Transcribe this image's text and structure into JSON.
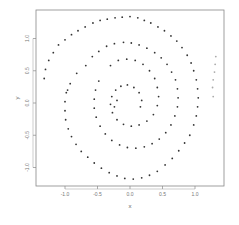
{
  "chart_data": {
    "type": "scatter",
    "title": "",
    "xlabel": "x",
    "ylabel": "y",
    "xlim": [
      -1.45,
      1.45
    ],
    "ylim": [
      -1.3,
      1.45
    ],
    "xticks": [
      -1.0,
      -0.5,
      0.0,
      0.5,
      1.0
    ],
    "xtick_labels": [
      "-1.0",
      "-0.5",
      "0.0",
      "0.5",
      "1.0"
    ],
    "yticks": [
      -1.0,
      -0.5,
      0.0,
      0.5,
      1.0
    ],
    "ytick_labels": [
      "-1.0",
      "-0.5",
      "0.0",
      "0.5",
      "1.0"
    ],
    "grid": false,
    "legend": null,
    "marker_color": "#333333",
    "outlier_color": "#aaaaaa",
    "series": [
      {
        "name": "spiral-arm-outer",
        "points": [
          [
            -1.32,
            0.38
          ],
          [
            -1.3,
            0.52
          ],
          [
            -1.25,
            0.66
          ],
          [
            -1.18,
            0.78
          ],
          [
            -1.1,
            0.9
          ],
          [
            -1.0,
            0.98
          ],
          [
            -0.9,
            1.06
          ],
          [
            -0.8,
            1.12
          ],
          [
            -0.69,
            1.18
          ],
          [
            -0.57,
            1.24
          ],
          [
            -0.46,
            1.28
          ],
          [
            -0.35,
            1.3
          ],
          [
            -0.23,
            1.32
          ],
          [
            -0.12,
            1.33
          ],
          [
            0.0,
            1.34
          ],
          [
            0.12,
            1.32
          ],
          [
            0.22,
            1.28
          ],
          [
            0.32,
            1.24
          ],
          [
            0.43,
            1.18
          ],
          [
            0.53,
            1.12
          ],
          [
            0.63,
            1.04
          ],
          [
            0.72,
            0.96
          ],
          [
            0.8,
            0.86
          ],
          [
            0.88,
            0.74
          ],
          [
            0.94,
            0.62
          ],
          [
            0.98,
            0.5
          ],
          [
            1.02,
            0.36
          ],
          [
            1.04,
            0.22
          ],
          [
            1.05,
            0.08
          ],
          [
            1.04,
            -0.06
          ],
          [
            1.02,
            -0.2
          ],
          [
            0.98,
            -0.34
          ],
          [
            0.92,
            -0.5
          ],
          [
            0.84,
            -0.62
          ],
          [
            0.75,
            -0.74
          ],
          [
            0.65,
            -0.86
          ],
          [
            0.54,
            -0.96
          ],
          [
            0.42,
            -1.06
          ],
          [
            0.3,
            -1.12
          ],
          [
            0.18,
            -1.16
          ],
          [
            0.05,
            -1.18
          ],
          [
            -0.08,
            -1.17
          ],
          [
            -0.2,
            -1.13
          ],
          [
            -0.32,
            -1.08
          ],
          [
            -0.44,
            -1.01
          ],
          [
            -0.55,
            -0.93
          ],
          [
            -0.65,
            -0.84
          ],
          [
            -0.75,
            -0.75
          ],
          [
            -0.83,
            -0.64
          ],
          [
            -0.9,
            -0.52
          ],
          [
            -0.95,
            -0.4
          ],
          [
            -0.99,
            -0.26
          ],
          [
            -1.0,
            -0.12
          ],
          [
            -1.0,
            0.02
          ],
          [
            -0.98,
            0.16
          ]
        ]
      },
      {
        "name": "spiral-arm-inner",
        "points": [
          [
            -0.68,
            0.58
          ],
          [
            -0.58,
            0.72
          ],
          [
            -0.48,
            0.8
          ],
          [
            -0.36,
            0.88
          ],
          [
            -0.24,
            0.92
          ],
          [
            -0.1,
            0.94
          ],
          [
            0.02,
            0.93
          ],
          [
            0.14,
            0.9
          ],
          [
            0.26,
            0.85
          ],
          [
            0.38,
            0.78
          ],
          [
            0.48,
            0.7
          ],
          [
            0.57,
            0.6
          ],
          [
            0.64,
            0.48
          ],
          [
            0.7,
            0.36
          ],
          [
            0.73,
            0.22
          ],
          [
            0.74,
            0.08
          ],
          [
            0.73,
            -0.06
          ],
          [
            0.69,
            -0.2
          ],
          [
            0.63,
            -0.34
          ],
          [
            0.55,
            -0.46
          ],
          [
            0.45,
            -0.56
          ],
          [
            0.34,
            -0.63
          ],
          [
            0.22,
            -0.68
          ],
          [
            0.09,
            -0.7
          ],
          [
            -0.04,
            -0.69
          ],
          [
            -0.16,
            -0.65
          ],
          [
            -0.28,
            -0.58
          ],
          [
            -0.38,
            -0.48
          ],
          [
            -0.46,
            -0.36
          ],
          [
            -0.52,
            -0.22
          ],
          [
            -0.55,
            -0.08
          ],
          [
            -0.55,
            0.06
          ],
          [
            -0.53,
            0.2
          ],
          [
            -0.48,
            0.34
          ],
          [
            -0.82,
            0.46
          ],
          [
            -0.92,
            0.3
          ],
          [
            -0.96,
            0.2
          ]
        ]
      },
      {
        "name": "spiral-arm-core",
        "points": [
          [
            -0.3,
            0.58
          ],
          [
            -0.18,
            0.66
          ],
          [
            -0.05,
            0.68
          ],
          [
            0.08,
            0.66
          ],
          [
            0.2,
            0.6
          ],
          [
            0.3,
            0.5
          ],
          [
            0.38,
            0.38
          ],
          [
            0.42,
            0.24
          ],
          [
            0.44,
            0.1
          ],
          [
            0.42,
            -0.04
          ],
          [
            0.36,
            -0.18
          ],
          [
            0.26,
            -0.28
          ],
          [
            0.14,
            -0.34
          ],
          [
            0.02,
            -0.36
          ],
          [
            -0.1,
            -0.33
          ],
          [
            -0.2,
            -0.26
          ],
          [
            -0.27,
            -0.15
          ],
          [
            -0.3,
            -0.02
          ],
          [
            -0.28,
            0.1
          ],
          [
            -0.22,
            0.2
          ],
          [
            -0.14,
            0.26
          ],
          [
            -0.04,
            0.28
          ],
          [
            0.06,
            0.24
          ],
          [
            0.14,
            0.16
          ],
          [
            0.18,
            0.04
          ],
          [
            0.16,
            -0.06
          ],
          [
            -0.24,
            -0.06
          ],
          [
            -0.2,
            0.04
          ]
        ]
      },
      {
        "name": "outliers-right",
        "points": [
          [
            1.32,
            0.72
          ],
          [
            1.31,
            0.6
          ],
          [
            1.3,
            0.48
          ],
          [
            1.28,
            0.36
          ],
          [
            1.27,
            0.24
          ],
          [
            1.28,
            0.1
          ]
        ]
      }
    ]
  }
}
